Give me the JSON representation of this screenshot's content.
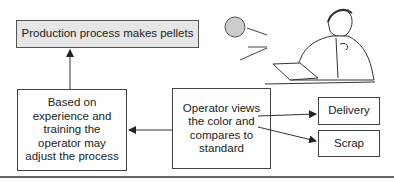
{
  "diagram": {
    "process_box": "Production process makes pellets",
    "adjust_box": "Based on experience and training the operator may adjust the process",
    "operator_box": "Operator views the color and compares to standard",
    "delivery_box": "Delivery",
    "scrap_box": "Scrap",
    "colors": {
      "sample_circle": "#cccccc",
      "process_fill": "#e6e6e6",
      "stroke": "#444444"
    }
  }
}
